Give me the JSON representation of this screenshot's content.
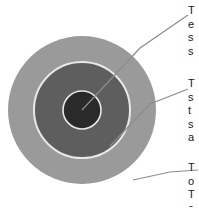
{
  "figure": {
    "type": "concentric-circle-callout-diagram",
    "background_color": "#ffffff",
    "note": "Cropped diagram: callout label text is clipped at the right edge of the image; only the first character column of each text line is rendered in the pixels."
  },
  "circles": {
    "outer": {
      "name": "outer-ring",
      "fill": "#9a9a9a",
      "cx": 82,
      "cy": 110,
      "r": 74
    },
    "middle": {
      "name": "middle-ring",
      "fill": "#5e5e5e",
      "stroke": "#e8e8e8",
      "cx": 82,
      "cy": 110,
      "r": 48
    },
    "inner": {
      "name": "inner-core",
      "fill": "#2a2a2a",
      "stroke": "#e8e8e8",
      "cx": 82,
      "cy": 110,
      "r": 19
    }
  },
  "leaders": {
    "stroke": "#8c8c8c",
    "top": "M 82,110 L 140,48 L 188,15",
    "middle": "M 110,146 L 150,104 L 188,89",
    "bottom": "M 133,180 L 170,172 L 198,170"
  },
  "callouts": {
    "top": {
      "name": "callout-top",
      "target": "inner-core",
      "lines": [
        "T",
        "e",
        "s",
        "s"
      ]
    },
    "middle": {
      "name": "callout-middle",
      "target": "middle-ring",
      "lines": [
        "T",
        "s",
        "t",
        "s",
        "a"
      ]
    },
    "bottom": {
      "name": "callout-bottom",
      "target": "outer-ring",
      "lines": [
        "T",
        "o",
        "T",
        "c"
      ]
    }
  }
}
